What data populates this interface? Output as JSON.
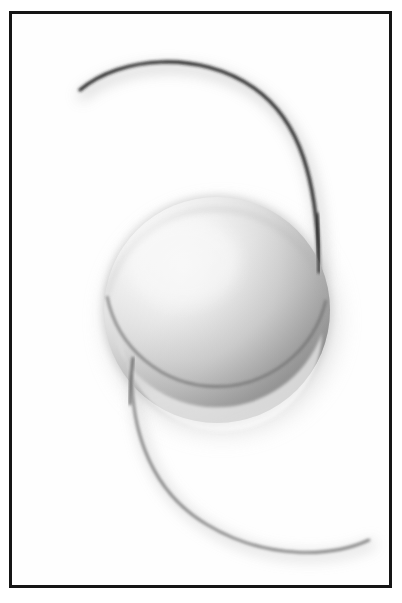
{
  "figure": {
    "title": "",
    "caption": "",
    "background_color": "#ffffff",
    "plate_color": "#fefefe",
    "frame_color": "#151515",
    "frame": {
      "x": 9,
      "y": 11,
      "width": 383,
      "height": 577,
      "border_width": 3
    }
  },
  "optic": {
    "name": "lens-optic-disc",
    "center_x": 217,
    "center_y": 310,
    "radius": 113,
    "highlight_x": 183,
    "highlight_y": 262,
    "highlight_color": "#f2f2f2",
    "mid_color": "#bdbdbd",
    "shadow_color": "#7d7d7d",
    "edge_color": "#6a6a6a",
    "halo_color": "#c9c9c9",
    "bevel_color": "#dedede"
  },
  "haptics": [
    {
      "name": "superior-haptic",
      "position": "upper",
      "stroke_color": "#1d1d1d",
      "stroke_width": 3.2,
      "shadow_color": "#c2c2c2",
      "start_x": 80,
      "start_y": 90,
      "end_x": 319,
      "end_y": 272,
      "path": "M 80 90 C 120 56, 200 50, 254 88 C 300 120, 318 180, 319 272"
    },
    {
      "name": "inferior-haptic",
      "position": "lower",
      "stroke_color": "#7a7a7a",
      "stroke_width": 2.6,
      "shadow_color": "#d8d8d8",
      "start_x": 133,
      "start_y": 358,
      "end_x": 369,
      "end_y": 540,
      "path": "M 133 358 C 128 420, 146 488, 206 524 C 268 562, 335 556, 369 540"
    }
  ],
  "shadows": {
    "optic_drop_shadow_color": "#cfcfcf",
    "optic_drop_shadow_opacity": 0.55
  }
}
